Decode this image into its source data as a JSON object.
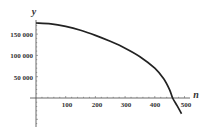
{
  "chart_data": {
    "type": "line",
    "title": "",
    "xlabel": "n",
    "ylabel": "y",
    "xlim": [
      0,
      500
    ],
    "ylim": [
      -60000,
      180000
    ],
    "grid": false,
    "legend": null,
    "x_ticks": [
      100,
      200,
      300,
      400,
      500
    ],
    "x_tick_labels": [
      "100",
      "200",
      "300",
      "400",
      "500"
    ],
    "y_ticks": [
      50000,
      100000,
      150000
    ],
    "y_tick_labels": [
      "50 000",
      "100 000",
      "150 000"
    ],
    "series": [
      {
        "name": "y(n)",
        "color": "#222222",
        "x": [
          0,
          50,
          100,
          150,
          200,
          250,
          300,
          350,
          400,
          430,
          450,
          460,
          475,
          490
        ],
        "values": [
          176000,
          174000,
          168000,
          159000,
          147000,
          133000,
          117000,
          97000,
          70000,
          45000,
          19000,
          0,
          -18000,
          -37000
        ]
      }
    ]
  },
  "axes": {
    "x_label": "n",
    "y_label": "y",
    "x_tick_labels": [
      "100",
      "200",
      "300",
      "400",
      "500"
    ],
    "y_tick_labels": [
      "150 000",
      "100 000",
      "50 000"
    ]
  }
}
